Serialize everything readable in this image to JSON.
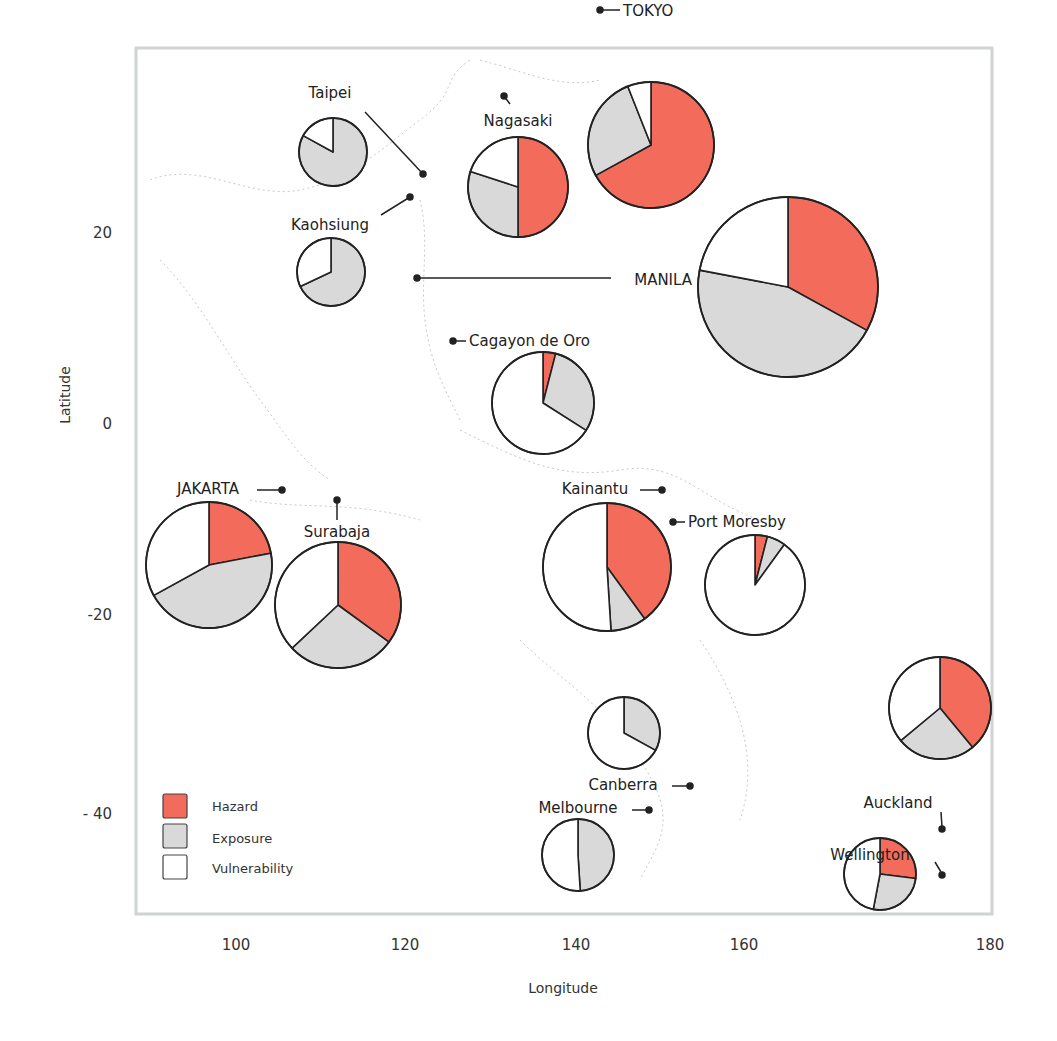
{
  "chart_data": {
    "type": "pie-map",
    "title": "",
    "xlabel": "Longitude",
    "ylabel": "Latitude",
    "x_ticks": [
      100,
      120,
      140,
      160,
      180
    ],
    "y_ticks": [
      20,
      0,
      -20,
      -40
    ],
    "y_tick_labels": [
      "20",
      "0",
      "-20",
      "- 40"
    ],
    "xlim": [
      90,
      180
    ],
    "ylim": [
      -50,
      38
    ],
    "grid": false,
    "legend_position": "lower-left",
    "slice_order": [
      "Hazard",
      "Exposure",
      "Vulnerability"
    ],
    "colors": {
      "Hazard": "#f26b5b",
      "Exposure": "#d9d9d9",
      "Vulnerability": "#ffffff"
    },
    "cities": [
      {
        "name": "Taipei",
        "lon": 121.5,
        "lat": 25.0,
        "pie_cx": 333,
        "pie_cy": 152,
        "r": 34,
        "hazard": 0,
        "exposure": 83,
        "vulnerability": 17
      },
      {
        "name": "Kaohsiung",
        "lon": 120.3,
        "lat": 22.6,
        "pie_cx": 331,
        "pie_cy": 272,
        "r": 34,
        "hazard": 0,
        "exposure": 68,
        "vulnerability": 32
      },
      {
        "name": "Nagasaki",
        "lon": 129.9,
        "lat": 32.8,
        "pie_cx": 518,
        "pie_cy": 187,
        "r": 50,
        "hazard": 50,
        "exposure": 30,
        "vulnerability": 20
      },
      {
        "name": "TOKYO",
        "lon": 139.7,
        "lat": 35.7,
        "pie_cx": 651,
        "pie_cy": 145,
        "r": 63,
        "hazard": 67,
        "exposure": 27,
        "vulnerability": 6
      },
      {
        "name": "MANILA",
        "lon": 121.0,
        "lat": 14.6,
        "pie_cx": 788,
        "pie_cy": 287,
        "r": 90,
        "hazard": 33,
        "exposure": 45,
        "vulnerability": 22
      },
      {
        "name": "Cagayon de Oro",
        "lon": 124.6,
        "lat": 8.5,
        "pie_cx": 543,
        "pie_cy": 403,
        "r": 51,
        "hazard": 4,
        "exposure": 30,
        "vulnerability": 66
      },
      {
        "name": "JAKARTA",
        "lon": 106.8,
        "lat": -6.2,
        "pie_cx": 209,
        "pie_cy": 565,
        "r": 63,
        "hazard": 22,
        "exposure": 45,
        "vulnerability": 33
      },
      {
        "name": "Surabaja",
        "lon": 112.7,
        "lat": -7.3,
        "pie_cx": 338,
        "pie_cy": 605,
        "r": 63,
        "hazard": 35,
        "exposure": 28,
        "vulnerability": 37
      },
      {
        "name": "Kainantu",
        "lon": 145.9,
        "lat": -6.3,
        "pie_cx": 607,
        "pie_cy": 567,
        "r": 64,
        "hazard": 40,
        "exposure": 9,
        "vulnerability": 51
      },
      {
        "name": "Port Moresby",
        "lon": 147.2,
        "lat": -9.4,
        "pie_cx": 755,
        "pie_cy": 585,
        "r": 50,
        "hazard": 4,
        "exposure": 6,
        "vulnerability": 90
      },
      {
        "name": "Canberra",
        "lon": 149.1,
        "lat": -35.3,
        "pie_cx": 624,
        "pie_cy": 733,
        "r": 36,
        "hazard": 0,
        "exposure": 33,
        "vulnerability": 67
      },
      {
        "name": "Melbourne",
        "lon": 145.0,
        "lat": -37.8,
        "pie_cx": 578,
        "pie_cy": 855,
        "r": 36,
        "hazard": 0,
        "exposure": 49,
        "vulnerability": 51
      },
      {
        "name": "Auckland",
        "lon": 174.8,
        "lat": -36.8,
        "pie_cx": 940,
        "pie_cy": 708,
        "r": 51,
        "hazard": 39,
        "exposure": 25,
        "vulnerability": 36
      },
      {
        "name": "Wellington",
        "lon": 174.8,
        "lat": -41.3,
        "pie_cx": 880,
        "pie_cy": 874,
        "r": 36,
        "hazard": 27,
        "exposure": 26,
        "vulnerability": 47
      }
    ]
  },
  "axes": {
    "xlabel": "Longitude",
    "ylabel": "Latitude",
    "x_ticks": [
      {
        "label": "100",
        "x": 236
      },
      {
        "label": "120",
        "x": 405
      },
      {
        "label": "140",
        "x": 576
      },
      {
        "label": "160",
        "x": 744
      },
      {
        "label": "180",
        "x": 990
      }
    ],
    "y_ticks": [
      {
        "label": "20",
        "y": 233
      },
      {
        "label": "0",
        "y": 424
      },
      {
        "label": "-20",
        "y": 615
      },
      {
        "label": "- 40",
        "y": 814
      }
    ]
  },
  "legend": {
    "items": [
      {
        "label": "Hazard",
        "color": "#f26b5b"
      },
      {
        "label": "Exposure",
        "color": "#d9d9d9"
      },
      {
        "label": "Vulnerability",
        "color": "#ffffff"
      }
    ]
  },
  "labels": [
    {
      "text": "TOKYO",
      "x": 623,
      "y": 16,
      "anchor": "start"
    },
    {
      "text": "Taipei",
      "x": 330,
      "y": 98,
      "anchor": "middle"
    },
    {
      "text": "Nagasaki",
      "x": 518,
      "y": 126,
      "anchor": "middle"
    },
    {
      "text": "Kaohsiung",
      "x": 330,
      "y": 230,
      "anchor": "middle"
    },
    {
      "text": "MANILA",
      "x": 692,
      "y": 285,
      "anchor": "end"
    },
    {
      "text": "Cagayon de Oro",
      "x": 469,
      "y": 346,
      "anchor": "start"
    },
    {
      "text": "JAKARTA",
      "x": 208,
      "y": 494,
      "anchor": "middle"
    },
    {
      "text": "Kainantu",
      "x": 595,
      "y": 494,
      "anchor": "middle"
    },
    {
      "text": "Port Moresby",
      "x": 688,
      "y": 527,
      "anchor": "start"
    },
    {
      "text": "Surabaja",
      "x": 337,
      "y": 537,
      "anchor": "middle"
    },
    {
      "text": "Auckland",
      "x": 898,
      "y": 808,
      "anchor": "middle"
    },
    {
      "text": "Canberra",
      "x": 623,
      "y": 790,
      "anchor": "middle"
    },
    {
      "text": "Melbourne",
      "x": 578,
      "y": 813,
      "anchor": "middle"
    },
    {
      "text": "Wellington",
      "x": 870,
      "y": 860,
      "anchor": "middle"
    }
  ]
}
